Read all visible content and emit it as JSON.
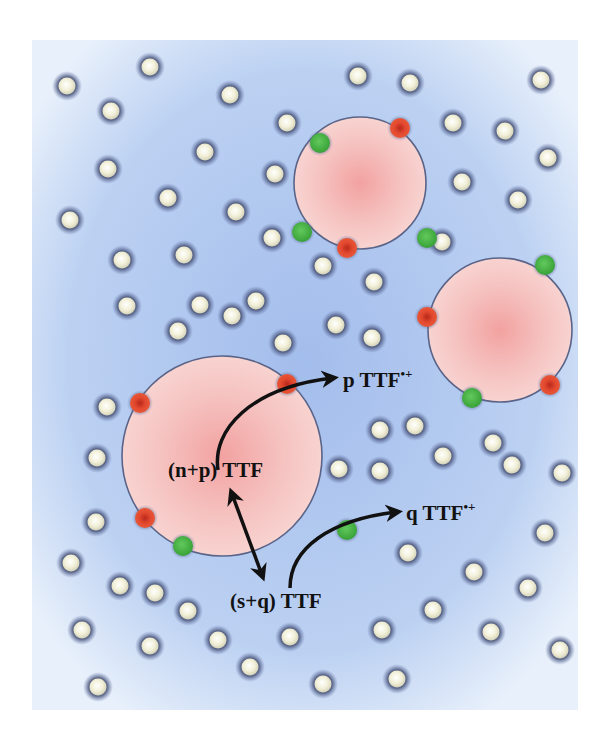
{
  "diagram": {
    "background": {
      "x": 32,
      "y": 40,
      "w": 546,
      "h": 670,
      "color_center": "#a9c3ee",
      "color_edge": "#e6effb"
    },
    "colors": {
      "molecule_fill": "#f3f1dc",
      "molecule_halo": "#4a5578",
      "domain_fill": "#f6c9c6",
      "domain_center": "#f3a6a4",
      "domain_stroke": "#5a6488",
      "green_site": "#4cb84a",
      "red_site": "#e0462e",
      "arrow": "#111111"
    },
    "domains": [
      {
        "cx": 360,
        "cy": 183,
        "r": 66
      },
      {
        "cx": 500,
        "cy": 330,
        "r": 72
      },
      {
        "cx": 222,
        "cy": 456,
        "r": 100
      }
    ],
    "sites": [
      {
        "cx": 320,
        "cy": 143,
        "color": "green"
      },
      {
        "cx": 400,
        "cy": 128,
        "color": "red"
      },
      {
        "cx": 302,
        "cy": 232,
        "color": "green"
      },
      {
        "cx": 427,
        "cy": 238,
        "color": "green"
      },
      {
        "cx": 347,
        "cy": 248,
        "color": "red"
      },
      {
        "cx": 545,
        "cy": 265,
        "color": "green"
      },
      {
        "cx": 427,
        "cy": 317,
        "color": "red"
      },
      {
        "cx": 550,
        "cy": 385,
        "color": "red"
      },
      {
        "cx": 472,
        "cy": 398,
        "color": "green"
      },
      {
        "cx": 140,
        "cy": 403,
        "color": "red"
      },
      {
        "cx": 287,
        "cy": 384,
        "color": "red"
      },
      {
        "cx": 145,
        "cy": 518,
        "color": "red"
      },
      {
        "cx": 183,
        "cy": 546,
        "color": "green"
      },
      {
        "cx": 347,
        "cy": 530,
        "color": "green"
      }
    ],
    "molecules": [
      [
        67,
        86
      ],
      [
        150,
        67
      ],
      [
        111,
        111
      ],
      [
        230,
        95
      ],
      [
        358,
        76
      ],
      [
        410,
        83
      ],
      [
        541,
        80
      ],
      [
        287,
        123
      ],
      [
        453,
        123
      ],
      [
        505,
        131
      ],
      [
        548,
        158
      ],
      [
        205,
        152
      ],
      [
        108,
        169
      ],
      [
        275,
        174
      ],
      [
        462,
        182
      ],
      [
        168,
        198
      ],
      [
        236,
        212
      ],
      [
        70,
        220
      ],
      [
        518,
        200
      ],
      [
        442,
        242
      ],
      [
        272,
        238
      ],
      [
        122,
        260
      ],
      [
        184,
        255
      ],
      [
        323,
        266
      ],
      [
        374,
        282
      ],
      [
        127,
        306
      ],
      [
        200,
        305
      ],
      [
        232,
        316
      ],
      [
        256,
        301
      ],
      [
        178,
        331
      ],
      [
        283,
        343
      ],
      [
        336,
        325
      ],
      [
        372,
        338
      ],
      [
        107,
        407
      ],
      [
        97,
        458
      ],
      [
        380,
        430
      ],
      [
        415,
        426
      ],
      [
        339,
        469
      ],
      [
        380,
        471
      ],
      [
        443,
        456
      ],
      [
        493,
        443
      ],
      [
        512,
        465
      ],
      [
        562,
        473
      ],
      [
        96,
        522
      ],
      [
        545,
        533
      ],
      [
        408,
        553
      ],
      [
        71,
        563
      ],
      [
        120,
        586
      ],
      [
        155,
        593
      ],
      [
        188,
        611
      ],
      [
        474,
        572
      ],
      [
        528,
        588
      ],
      [
        82,
        630
      ],
      [
        150,
        646
      ],
      [
        218,
        640
      ],
      [
        290,
        637
      ],
      [
        382,
        630
      ],
      [
        433,
        610
      ],
      [
        491,
        632
      ],
      [
        560,
        650
      ],
      [
        98,
        687
      ],
      [
        250,
        667
      ],
      [
        323,
        684
      ],
      [
        397,
        679
      ]
    ],
    "labels": {
      "np_ttf": "(n+p) TTF",
      "sq_ttf": "(s+q) TTF",
      "p_ttf": "p TTF",
      "q_ttf": "q TTF",
      "radical_cation": "•+"
    }
  }
}
